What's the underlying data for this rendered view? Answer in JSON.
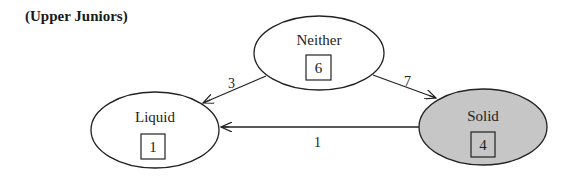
{
  "title": "(Upper Juniors)",
  "nodes": [
    {
      "id": "neither",
      "label": "Neither",
      "count": "6",
      "fill": "#ffffff"
    },
    {
      "id": "liquid",
      "label": "Liquid",
      "count": "1",
      "fill": "#ffffff"
    },
    {
      "id": "solid",
      "label": "Solid",
      "count": "4",
      "fill": "#c6c6c6"
    }
  ],
  "edges": [
    {
      "from": "Neither",
      "to": "Liquid",
      "label": "3"
    },
    {
      "from": "Neither",
      "to": "Solid",
      "label": "7"
    },
    {
      "from": "Solid",
      "to": "Liquid",
      "label": "1"
    }
  ],
  "colors": {
    "stroke": "#222222",
    "solid_fill": "#c6c6c6"
  }
}
